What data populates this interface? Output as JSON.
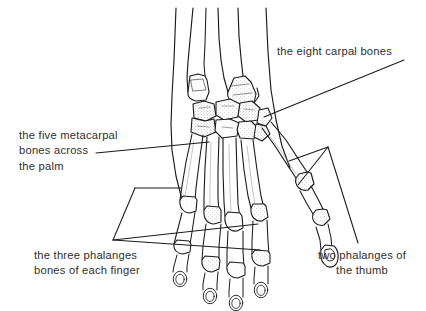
{
  "figure": {
    "kind": "anatomical-line-drawing",
    "background_color": "#ffffff",
    "ink_color": "#1a1a1a",
    "text_color": "#2e2e2e"
  },
  "labels": {
    "carpal": {
      "text": "the eight carpal bones",
      "name": "label-the-eight-carpal-bones"
    },
    "metacarpal": {
      "text": "the five metacarpal\nbones across\nthe palm",
      "name": "label-the-five-metacarpal-bones"
    },
    "phalanges": {
      "text": "the three phalanges\nbones of each finger",
      "name": "label-the-three-phalanges-bones"
    },
    "thumb": {
      "text": "two phalanges of\nthe thumb",
      "name": "label-two-phalanges-of-the-thumb"
    }
  },
  "leaders": {
    "carpal_label": "leader line from carpal label down-left to carpal bones",
    "metacarpal_label": "leader line from metacarpal label up-right to a metacarpal shaft",
    "phalanges_bracket": "triangular bracket spanning the phalanges of the index finger",
    "thumb_bracket": "triangular bracket spanning the two phalanges of the thumb"
  }
}
